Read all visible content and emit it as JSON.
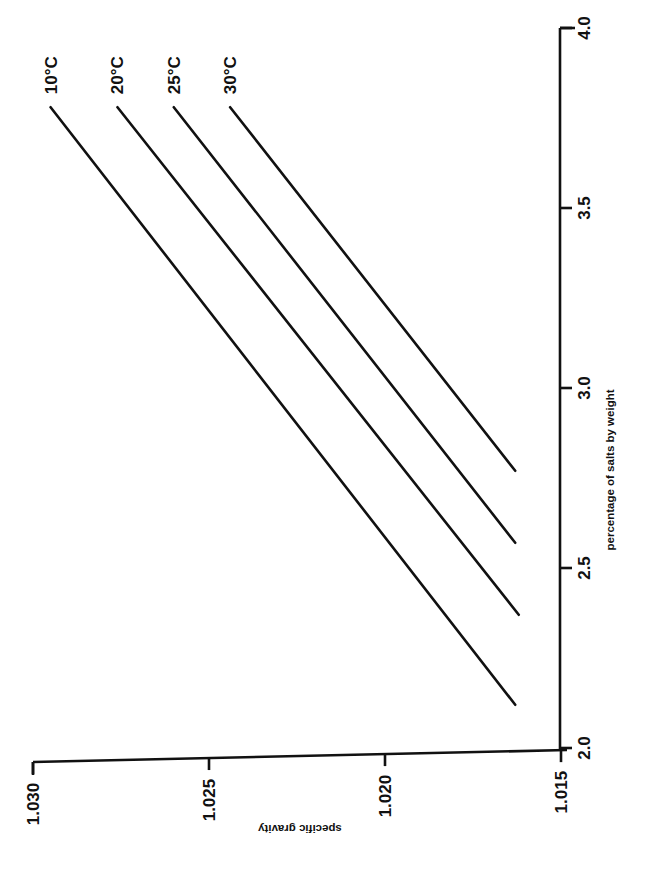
{
  "chart_data": {
    "type": "line",
    "title": "",
    "orientation_note": "figure printed rotated 90 degrees clockwise",
    "xlabel": "percentage of salts by weight",
    "ylabel": "specific gravity",
    "xlim": [
      2.0,
      4.0
    ],
    "ylim": [
      1.015,
      1.03
    ],
    "x_ticks": [
      "2.0",
      "2.5",
      "3.0",
      "3.5",
      "4.0"
    ],
    "y_ticks": [
      "1.015",
      "1.020",
      "1.025",
      "1.030"
    ],
    "grid": false,
    "legend": "inline labels at line ends",
    "series": [
      {
        "name": "10°C",
        "x": [
          2.12,
          3.78
        ],
        "y": [
          1.0163,
          1.0295
        ]
      },
      {
        "name": "20°C",
        "x": [
          2.37,
          3.78
        ],
        "y": [
          1.0162,
          1.0276
        ]
      },
      {
        "name": "25°C",
        "x": [
          2.57,
          3.78
        ],
        "y": [
          1.0163,
          1.026
        ]
      },
      {
        "name": "30°C",
        "x": [
          2.77,
          3.78
        ],
        "y": [
          1.0163,
          1.0244
        ]
      }
    ]
  },
  "labels": {
    "xlabel": "percentage of salts by weight",
    "ylabel": "specific gravity",
    "x_ticks": [
      "2.0",
      "2.5",
      "3.0",
      "3.5",
      "4.0"
    ],
    "y_ticks": [
      "1.015",
      "1.020",
      "1.025",
      "1.030"
    ],
    "series": [
      "10°C",
      "20°C",
      "25°C",
      "30°C"
    ]
  }
}
